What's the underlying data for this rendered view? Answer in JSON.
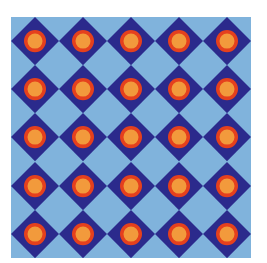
{
  "image": {
    "description": "Geometric tile pattern: 5x5 grid of navy diamonds on light blue, each with concentric red and orange circles",
    "grid": {
      "rows": 5,
      "cols": 5
    }
  },
  "colors": {
    "background": "#80b3dc",
    "diamond": "#2b2a8c",
    "outer_circle": "#e5401d",
    "inner_circle": "#f29a3c"
  },
  "tile": {
    "outer_circle_radius": 11,
    "inner_circle_radius": 7.5
  }
}
